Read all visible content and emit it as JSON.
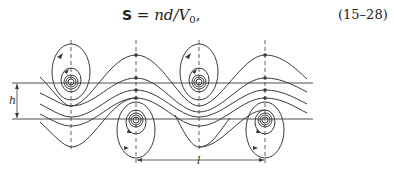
{
  "equation": {
    "symbol": "S",
    "relation": " = nd/V",
    "subscript": "0",
    "trailing": ",",
    "number": "(15–28)"
  },
  "figure": {
    "labels": {
      "h": "h",
      "l": "l"
    },
    "colors": {
      "line": "#3a3a3a"
    }
  }
}
